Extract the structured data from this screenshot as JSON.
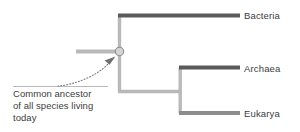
{
  "figure": {
    "type": "phylogenetic-tree",
    "domains": [
      {
        "id": "bacteria",
        "label": "Bacteria"
      },
      {
        "id": "archaea",
        "label": "Archaea"
      },
      {
        "id": "eukarya",
        "label": "Eukarya"
      }
    ],
    "annotation": {
      "lines": [
        "Common ancestor",
        "of all species living",
        "today"
      ]
    },
    "colors": {
      "terminal_branch": "#5a5a5a",
      "internal_branch": "#b9b9b9",
      "node_fill": "#d4d4d4",
      "node_stroke": "#8a8a8a",
      "pointer": "#9a9a9a",
      "text": "#3d3d3d",
      "background": "#ffffff"
    },
    "node": {
      "name": "common-ancestor-node",
      "x": 119,
      "y": 52
    }
  }
}
